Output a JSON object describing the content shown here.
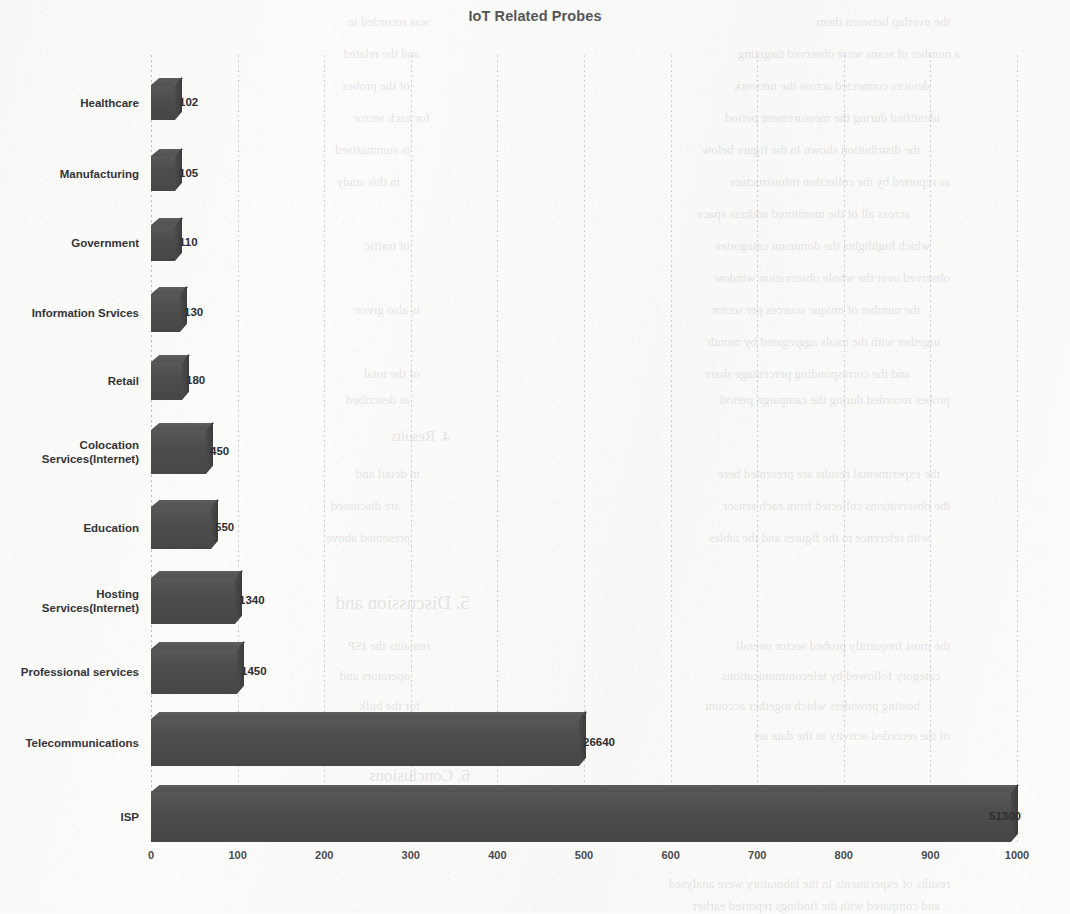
{
  "chart_data": {
    "type": "bar",
    "orientation": "horizontal",
    "title": "IoT Related Probes",
    "xlabel": "",
    "ylabel": "",
    "xlim": [
      0,
      1000
    ],
    "grid": true,
    "legend": "none",
    "xticks": [
      "0",
      "100",
      "200",
      "300",
      "400",
      "500",
      "600",
      "700",
      "800",
      "900",
      "1000"
    ],
    "categories": [
      "Healthcare",
      "Manufacturing",
      "Government",
      "Information Srvices",
      "Retail",
      "Colocation\nServices(Internet)",
      "Education",
      "Hosting\nServices(Internet)",
      "Professional services",
      "Telecommunications",
      "ISP"
    ],
    "values": [
      102,
      105,
      110,
      130,
      180,
      450,
      550,
      1340,
      1450,
      26640,
      51300
    ],
    "value_labels": [
      "102",
      "105",
      "110",
      "130",
      "180",
      "450",
      "550",
      "1340",
      "1450",
      "26640",
      "51300"
    ],
    "bar_color": "#4d4d4d",
    "note": "Rendered bar lengths do not scale linearly with the labelled values; axis is drawn 0-1000 while the two largest labels read 26640 and 51300."
  },
  "bar_geometry": {
    "plot_left_px": 151,
    "plot_width_px": 866,
    "rows": [
      {
        "top": 85,
        "height": 35,
        "width": 24,
        "label_x": 28
      },
      {
        "top": 156,
        "height": 35,
        "width": 24,
        "label_x": 28
      },
      {
        "top": 225,
        "height": 36,
        "width": 24,
        "label_x": 28
      },
      {
        "top": 294,
        "height": 38,
        "width": 29,
        "label_x": 33
      },
      {
        "top": 362,
        "height": 38,
        "width": 31,
        "label_x": 35
      },
      {
        "top": 430,
        "height": 44,
        "width": 55,
        "label_x": 59
      },
      {
        "top": 507,
        "height": 42,
        "width": 60,
        "label_x": 64
      },
      {
        "top": 578,
        "height": 46,
        "width": 84,
        "label_x": 88
      },
      {
        "top": 649,
        "height": 45,
        "width": 86,
        "label_x": 90
      },
      {
        "top": 719,
        "height": 47,
        "width": 428,
        "label_x": 432
      },
      {
        "top": 792,
        "height": 50,
        "width": 860,
        "label_x": 838
      }
    ]
  },
  "bleed_text": [
    {
      "x": 120,
      "y": 14,
      "size": 13,
      "text": "the overlap between them"
    },
    {
      "x": 640,
      "y": 14,
      "size": 13,
      "text": "was recorded in"
    },
    {
      "x": 110,
      "y": 46,
      "size": 13,
      "text": "a number of scans were observed targeting"
    },
    {
      "x": 650,
      "y": 46,
      "size": 13,
      "text": "and the related"
    },
    {
      "x": 140,
      "y": 78,
      "size": 13,
      "text": "devices connected across the network"
    },
    {
      "x": 660,
      "y": 78,
      "size": 13,
      "text": "of the probes"
    },
    {
      "x": 130,
      "y": 110,
      "size": 13,
      "text": "identified during the measurement period"
    },
    {
      "x": 640,
      "y": 110,
      "size": 13,
      "text": "for each sector"
    },
    {
      "x": 150,
      "y": 142,
      "size": 13,
      "text": "the distribution shown in the figure below"
    },
    {
      "x": 660,
      "y": 142,
      "size": 13,
      "text": "is summarised"
    },
    {
      "x": 120,
      "y": 174,
      "size": 13,
      "text": "as reported by the collection infrastructure"
    },
    {
      "x": 670,
      "y": 174,
      "size": 13,
      "text": "in this study"
    },
    {
      "x": 160,
      "y": 206,
      "size": 13,
      "text": "across all of the monitored address space"
    },
    {
      "x": 140,
      "y": 238,
      "size": 13,
      "text": "which highlights the dominant categories"
    },
    {
      "x": 660,
      "y": 238,
      "size": 13,
      "text": "of traffic"
    },
    {
      "x": 120,
      "y": 270,
      "size": 13,
      "text": "observed over the whole observation window"
    },
    {
      "x": 150,
      "y": 302,
      "size": 13,
      "text": "the number of unique sources per sector"
    },
    {
      "x": 650,
      "y": 302,
      "size": 13,
      "text": "is also given"
    },
    {
      "x": 130,
      "y": 334,
      "size": 13,
      "text": "together with the totals aggregated by month"
    },
    {
      "x": 160,
      "y": 366,
      "size": 13,
      "text": "and the corresponding percentage share"
    },
    {
      "x": 650,
      "y": 366,
      "size": 13,
      "text": "of the total"
    },
    {
      "x": 120,
      "y": 392,
      "size": 13,
      "text": "probes recorded during the campaign period"
    },
    {
      "x": 660,
      "y": 392,
      "size": 13,
      "text": "as described"
    },
    {
      "x": 620,
      "y": 428,
      "size": 15,
      "text": "4. Results"
    },
    {
      "x": 130,
      "y": 466,
      "size": 13,
      "text": "the experimental results are presented here"
    },
    {
      "x": 650,
      "y": 466,
      "size": 13,
      "text": "in detail and"
    },
    {
      "x": 120,
      "y": 498,
      "size": 13,
      "text": "the observations collected from each sensor"
    },
    {
      "x": 670,
      "y": 498,
      "size": 13,
      "text": "are discussed"
    },
    {
      "x": 140,
      "y": 530,
      "size": 13,
      "text": "with reference to the figures and the tables"
    },
    {
      "x": 660,
      "y": 530,
      "size": 13,
      "text": "presented above"
    },
    {
      "x": 600,
      "y": 592,
      "size": 19,
      "text": "5. Discussion and"
    },
    {
      "x": 120,
      "y": 638,
      "size": 13,
      "text": "the most frequently probed sector overall"
    },
    {
      "x": 640,
      "y": 638,
      "size": 13,
      "text": "remains the ISP"
    },
    {
      "x": 130,
      "y": 668,
      "size": 13,
      "text": "category followed by telecommunications"
    },
    {
      "x": 660,
      "y": 668,
      "size": 13,
      "text": "operators and"
    },
    {
      "x": 150,
      "y": 698,
      "size": 13,
      "text": "hosting providers which together account"
    },
    {
      "x": 650,
      "y": 698,
      "size": 13,
      "text": "for the bulk"
    },
    {
      "x": 120,
      "y": 728,
      "size": 13,
      "text": "of the recorded activity in the data set"
    },
    {
      "x": 660,
      "y": 728,
      "size": 13,
      "text": "under review"
    },
    {
      "x": 600,
      "y": 766,
      "size": 17,
      "text": "6. Conclusions"
    },
    {
      "x": 120,
      "y": 876,
      "size": 13,
      "text": "results of experiments in the laboratory were analysed"
    },
    {
      "x": 130,
      "y": 898,
      "size": 13,
      "text": "and compared with the findings reported earlier"
    }
  ]
}
